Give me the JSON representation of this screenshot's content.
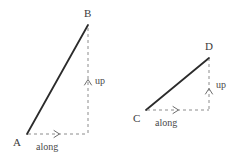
{
  "figure": {
    "background_color": "#ffffff",
    "hypotenuse_color": "#2b2b2b",
    "dashed_color": "#8c8c8c",
    "label_color": "#3b3b3b"
  },
  "triangles": [
    {
      "id": "left",
      "start_label": "A",
      "end_label": "B",
      "horizontal_label": "along",
      "vertical_label": "up",
      "start_point": {
        "x": 27,
        "y": 134
      },
      "end_point": {
        "x": 88,
        "y": 25
      },
      "corner_point": {
        "x": 88,
        "y": 134
      },
      "horizontal_run": 61,
      "vertical_rise": 109
    },
    {
      "id": "right",
      "start_label": "C",
      "end_label": "D",
      "horizontal_label": "along",
      "vertical_label": "up",
      "start_point": {
        "x": 146,
        "y": 110
      },
      "end_point": {
        "x": 209,
        "y": 58
      },
      "corner_point": {
        "x": 209,
        "y": 110
      },
      "horizontal_run": 63,
      "vertical_rise": 52
    }
  ],
  "labels": {
    "a": "A",
    "b": "B",
    "c": "C",
    "d": "D",
    "along_left": "along",
    "up_left": "up",
    "along_right": "along",
    "up_right": "up"
  }
}
